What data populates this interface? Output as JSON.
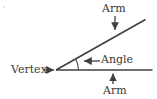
{
  "figure": {
    "kind": "geometry-angle-diagram",
    "width": 157,
    "height": 99,
    "background_color": "#ffffff",
    "line_color": "#3f3f3f",
    "text_color": "#3a3a3a"
  },
  "labels": {
    "arm_top": "Arm",
    "arm_bottom": "Arm",
    "angle": "Angle",
    "vertex": "Vertex"
  },
  "geometry": {
    "vertex_point": {
      "x": 56,
      "y": 70
    },
    "horizontal_ray_end": {
      "x": 152,
      "y": 70
    },
    "diagonal_ray_end": {
      "x": 145,
      "y": 20
    },
    "angle_arc_radius": 22,
    "angle_degrees": 29
  },
  "leaders": {
    "vertex_arrow": {
      "from_x": 44,
      "to_x": 56,
      "y": 70,
      "direction": "right"
    },
    "arm_top_arrow": {
      "x": 115,
      "from_y": 16,
      "to_y": 32,
      "direction": "down"
    },
    "arm_bottom_arrow": {
      "x": 113,
      "from_y": 84,
      "to_y": 72,
      "direction": "up"
    },
    "angle_arrow": {
      "from_x": 100,
      "to_x": 82,
      "y": 61,
      "direction": "left"
    }
  },
  "icons": {
    "arrow_right": "arrow-right-icon",
    "arrow_left": "arrow-left-icon",
    "arrow_up": "arrow-up-icon",
    "arrow_down": "arrow-down-icon"
  }
}
